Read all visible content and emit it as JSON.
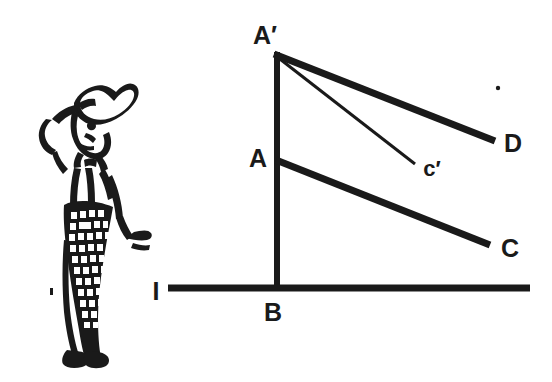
{
  "figure": {
    "background_color": "#ffffff",
    "ink_color": "#1a1a1a",
    "labels": {
      "a_prime": "A′",
      "a": "A",
      "b": "B",
      "c": "C",
      "c_prime": "c′",
      "d": "D",
      "i": "I"
    },
    "illustration": {
      "name": "man-in-chef-hat-scratching-head",
      "description": "Line drawing of a standing person wearing a tall hat, one hand raised to the head, wearing checkered trousers"
    },
    "geometry": {
      "description": "Right triangle diagram: vertical pole from B up through A to A-prime standing on horizontal ground line I; thick segment A-prime to D; thin segment A-prime to c-prime; thick segment A to C",
      "points": {
        "A_prime": [
          274,
          52
        ],
        "A": [
          277,
          160
        ],
        "B": [
          277,
          288
        ],
        "C": [
          490,
          245
        ],
        "D": [
          495,
          140
        ],
        "c_prime": [
          415,
          163
        ],
        "ground_left": [
          168,
          288
        ],
        "ground_right": [
          530,
          288
        ]
      },
      "stroke_widths": {
        "ground_line": 7,
        "pole": 6,
        "a_prime_to_d": 7,
        "a_to_c": 7,
        "a_prime_to_c_prime": 3
      }
    },
    "speck": {
      "name": "ink-speck",
      "position": [
        498,
        88
      ],
      "radius": 2
    }
  }
}
